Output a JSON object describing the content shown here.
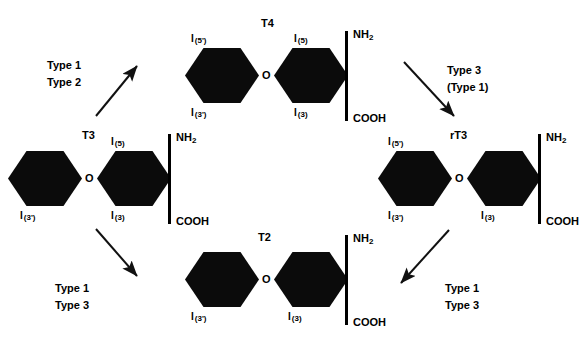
{
  "diagram": {
    "title_alt": "Thyroid hormone deiodination pathways",
    "ether_oxygen": "O",
    "ink_color": "#0b0b0b"
  },
  "molecules": {
    "t4": {
      "title": "T4",
      "outer_ring_upper": "I",
      "outer_ring_upper_pos": "(5')",
      "outer_ring_lower": "I",
      "outer_ring_lower_pos": "(3')",
      "inner_ring_upper": "I",
      "inner_ring_upper_pos": "(5)",
      "inner_ring_lower": "I",
      "inner_ring_lower_pos": "(3)",
      "amine": "NH",
      "amine_sub": "2",
      "acid": "COOH",
      "ether": "O"
    },
    "t3": {
      "title": "T3",
      "outer_ring_lower": "I",
      "outer_ring_lower_pos": "(3')",
      "inner_ring_upper": "I",
      "inner_ring_upper_pos": "(5)",
      "inner_ring_lower": "I",
      "inner_ring_lower_pos": "(3)",
      "amine": "NH",
      "amine_sub": "2",
      "acid": "COOH",
      "ether": "O"
    },
    "rt3": {
      "title": "rT3",
      "outer_ring_upper": "I",
      "outer_ring_upper_pos": "(5')",
      "outer_ring_lower": "I",
      "outer_ring_lower_pos": "(3')",
      "inner_ring_lower": "I",
      "inner_ring_lower_pos": "(3)",
      "amine": "NH",
      "amine_sub": "2",
      "acid": "COOH",
      "ether": "O"
    },
    "t2": {
      "title": "T2",
      "outer_ring_lower": "I",
      "outer_ring_lower_pos": "(3')",
      "inner_ring_lower": "I",
      "inner_ring_lower_pos": "(3)",
      "amine": "NH",
      "amine_sub": "2",
      "acid": "COOH",
      "ether": "O"
    }
  },
  "pathways": {
    "t4_to_t3": {
      "line1": "Type 1",
      "line2": "Type 2"
    },
    "t4_to_rt3": {
      "line1": "Type 3",
      "line2": "(Type 1)"
    },
    "t3_to_t2": {
      "line1": "Type 1",
      "line2": "Type 3"
    },
    "rt3_to_t2": {
      "line1": "Type 1",
      "line2": "Type 3"
    }
  }
}
